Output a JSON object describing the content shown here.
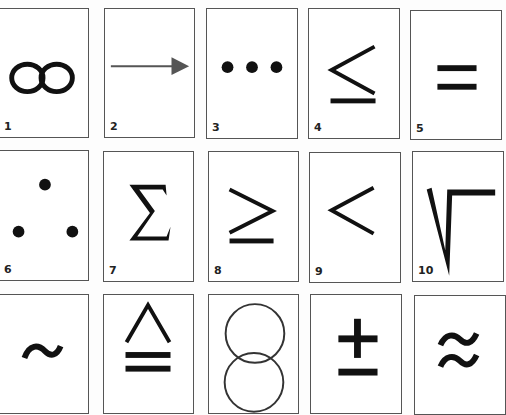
{
  "cards": [
    {
      "number": "1",
      "symbol": "infinity"
    },
    {
      "number": "2",
      "symbol": "right-arrow"
    },
    {
      "number": "3",
      "symbol": "ellipsis"
    },
    {
      "number": "4",
      "symbol": "less-than-or-equal"
    },
    {
      "number": "5",
      "symbol": "equals"
    },
    {
      "number": "6",
      "symbol": "therefore-dots"
    },
    {
      "number": "7",
      "symbol": "sigma-summation"
    },
    {
      "number": "8",
      "symbol": "greater-than-or-equal"
    },
    {
      "number": "9",
      "symbol": "less-than"
    },
    {
      "number": "10",
      "symbol": "square-root"
    },
    {
      "number": "",
      "symbol": "tilde"
    },
    {
      "number": "",
      "symbol": "delta-equal"
    },
    {
      "number": "",
      "symbol": "overlapping-circles"
    },
    {
      "number": "",
      "symbol": "plus-minus"
    },
    {
      "number": "",
      "symbol": "approximately-equal"
    }
  ],
  "colors": {
    "ink": "#111111",
    "arrow": "#555555",
    "border": "#555555"
  }
}
